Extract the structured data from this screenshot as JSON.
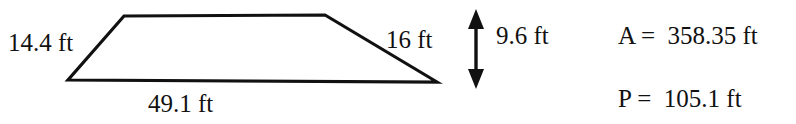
{
  "figure": {
    "type": "geometry-diagram",
    "shape": "trapezoid",
    "background_color": "#ffffff",
    "stroke_color": "#111111",
    "stroke_width_px": 3
  },
  "shape_labels": {
    "left_leg": "14.4 ft",
    "bottom_base": "49.1 ft",
    "right_leg": "16 ft",
    "height": "9.6 ft"
  },
  "results": {
    "area": "A =  358.35 ft",
    "perimeter": "P =  105.1 ft"
  },
  "icons": {
    "height_arrow": "double-headed-vertical-arrow-icon"
  },
  "geometry": {
    "trapezoid_points": "124,16 325,15 437,82 68,80",
    "arrow_x": 476,
    "arrow_top_y": 12,
    "arrow_bottom_y": 86
  },
  "chart_data": {
    "type": "diagram",
    "title": "",
    "shape": "trapezoid",
    "measurements": [
      {
        "name": "left leg",
        "label": "14.4 ft",
        "value": 14.4,
        "unit": "ft"
      },
      {
        "name": "top base",
        "label": "",
        "value": null,
        "unit": "ft"
      },
      {
        "name": "right leg",
        "label": "16 ft",
        "value": 16,
        "unit": "ft"
      },
      {
        "name": "bottom base",
        "label": "49.1 ft",
        "value": 49.1,
        "unit": "ft"
      },
      {
        "name": "height",
        "label": "9.6 ft",
        "value": 9.6,
        "unit": "ft"
      }
    ],
    "computed": [
      {
        "name": "Area",
        "symbol": "A",
        "label": "358.35 ft",
        "value": 358.35,
        "unit": "ft"
      },
      {
        "name": "Perimeter",
        "symbol": "P",
        "label": "105.1 ft",
        "value": 105.1,
        "unit": "ft"
      }
    ]
  }
}
